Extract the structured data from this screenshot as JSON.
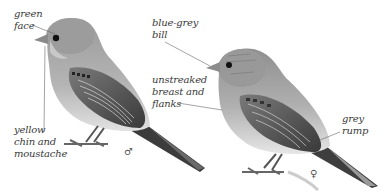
{
  "figure": {
    "male": {
      "sex_symbol": "♂",
      "labels": [
        {
          "id": "green-face",
          "text": "green\nface"
        },
        {
          "id": "yellow-chin",
          "text": "yellow\nchin and\nmoustache"
        }
      ]
    },
    "female": {
      "sex_symbol": "♀",
      "labels": [
        {
          "id": "blue-grey-bill",
          "text": "blue-grey\nbill"
        },
        {
          "id": "unstreaked-breast",
          "text": "unstreaked\nbreast and\nflanks"
        },
        {
          "id": "grey-rump",
          "text": "grey\nrump"
        }
      ]
    }
  }
}
